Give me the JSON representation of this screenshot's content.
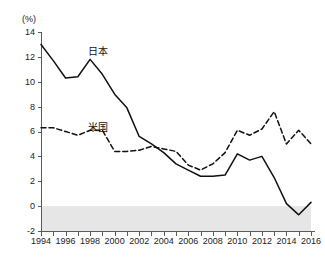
{
  "chart_data": {
    "type": "line",
    "title": "",
    "subtitle": "",
    "unit_label": "(%)",
    "xlabel": "",
    "ylabel": "",
    "ylim": [
      -2,
      14
    ],
    "ytick_step": 2,
    "yticks": [
      "14",
      "12",
      "10",
      "8",
      "6",
      "4",
      "2",
      "0",
      "-2"
    ],
    "xlim": [
      1994,
      2016
    ],
    "xticks": [
      "1994",
      "1996",
      "1998",
      "2000",
      "2002",
      "2004",
      "2006",
      "2008",
      "2010",
      "2012",
      "2014",
      "2016"
    ],
    "x": [
      1994,
      1995,
      1996,
      1997,
      1998,
      1999,
      2000,
      2001,
      2002,
      2003,
      2004,
      2005,
      2006,
      2007,
      2008,
      2009,
      2010,
      2011,
      2012,
      2013,
      2014,
      2015,
      2016
    ],
    "grid": false,
    "legend_position": "inline-annotation",
    "shaded_region": {
      "from": 0,
      "to": -2,
      "color": "#e6e6e6"
    },
    "series": [
      {
        "name": "日本",
        "style": "solid",
        "color": "#111111",
        "label_annotation": "日本",
        "values": [
          13.0,
          11.7,
          10.3,
          10.4,
          11.8,
          10.6,
          9.0,
          7.9,
          5.6,
          5.0,
          4.3,
          3.4,
          2.9,
          2.4,
          2.4,
          2.5,
          4.2,
          3.7,
          4.0,
          2.3,
          0.2,
          -0.7,
          0.3
        ]
      },
      {
        "name": "米国",
        "style": "dashed",
        "color": "#111111",
        "label_annotation": "米国",
        "values": [
          6.3,
          6.3,
          6.0,
          5.7,
          6.1,
          6.1,
          4.4,
          4.4,
          4.5,
          4.8,
          4.6,
          4.4,
          3.3,
          2.9,
          3.4,
          4.3,
          6.1,
          5.7,
          6.2,
          7.6,
          5.0,
          6.1,
          5.0
        ]
      }
    ]
  }
}
